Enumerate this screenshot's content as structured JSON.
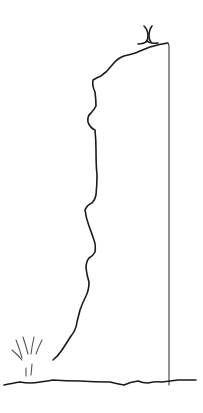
{
  "drawing": {
    "subject": "hand-drawn sketch of a tall cliff with a small figure on top",
    "elements": [
      {
        "name": "figure-on-top",
        "description": "small stick figure with raised arms standing on the cliff top"
      },
      {
        "name": "cliff-outline",
        "description": "jagged left face of a tall cliff"
      },
      {
        "name": "cliff-right-edge",
        "description": "straight vertical right edge of the cliff"
      },
      {
        "name": "grass-tuft",
        "description": "small tuft of grass at bottom left"
      },
      {
        "name": "ground-line",
        "description": "uneven horizontal ground line"
      }
    ],
    "colors": {
      "background": "#ffffff",
      "ink": "#1a1a1a",
      "thin_ink": "#3a3a3a",
      "grass": "#555555"
    }
  }
}
